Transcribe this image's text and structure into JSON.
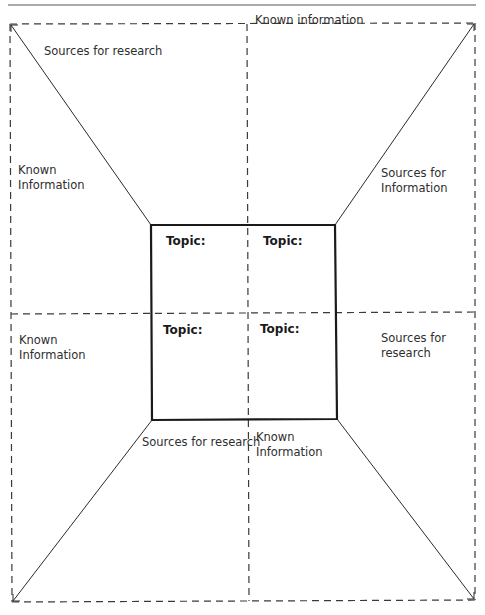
{
  "page": {
    "title_rule": true
  },
  "diagram": {
    "type": "graphic-organizer",
    "colors": {
      "dashed_line": "#3a3a3a",
      "solid_line": "#2a2a2a",
      "inner_box": "#1a1a1a",
      "text": "#2e2e2e"
    },
    "outer_labels": {
      "top_left": "Sources for research",
      "top_right": "Known information",
      "left_upper_line1": "Known",
      "left_upper_line2": "Information",
      "right_upper_line1": "Sources for",
      "right_upper_line2": "Information",
      "left_lower_line1": "Known",
      "left_lower_line2": "Information",
      "right_lower_line1": "Sources for",
      "right_lower_line2": "research",
      "bottom_left": "Sources for research",
      "bottom_right_line1": "Known",
      "bottom_right_line2": "Information"
    },
    "topics": [
      {
        "label": "Topic:"
      },
      {
        "label": "Topic:"
      },
      {
        "label": "Topic:"
      },
      {
        "label": "Topic:"
      }
    ]
  }
}
